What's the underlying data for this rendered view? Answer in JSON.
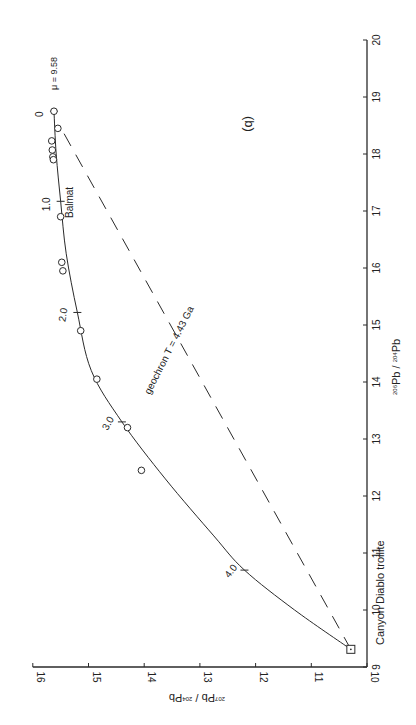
{
  "chart_data": {
    "type": "scatter",
    "orientation": "rotated-90-clockwise",
    "panel_label": "(b)",
    "xlabel": "206Pb / 204Pb",
    "ylabel": "207Pb / 204Pb",
    "xlim": [
      9,
      20
    ],
    "ylim": [
      10,
      16
    ],
    "x_ticks": [
      9,
      10,
      11,
      12,
      13,
      14,
      15,
      16,
      17,
      18,
      19,
      20
    ],
    "y_ticks": [
      10,
      11,
      12,
      13,
      14,
      15,
      16
    ],
    "grid": false,
    "growth_curve": {
      "name": "μ = 9.58",
      "age_labels": [
        {
          "label": "0",
          "x": 18.75,
          "y": 15.62
        },
        {
          "label": "1.0",
          "x": 17.17,
          "y": 15.5
        },
        {
          "label": "2.0",
          "x": 15.22,
          "y": 15.2
        },
        {
          "label": "3.0",
          "x": 13.3,
          "y": 14.4
        },
        {
          "label": "4.0",
          "x": 10.7,
          "y": 12.2
        }
      ],
      "minor_ticks_Ga": [
        0.5,
        1.5,
        2.5,
        3.5
      ],
      "points": [
        {
          "x": 18.75,
          "y": 15.62
        },
        {
          "x": 18.0,
          "y": 15.58
        },
        {
          "x": 17.17,
          "y": 15.5
        },
        {
          "x": 16.25,
          "y": 15.4
        },
        {
          "x": 15.22,
          "y": 15.2
        },
        {
          "x": 14.2,
          "y": 14.95
        },
        {
          "x": 13.3,
          "y": 14.4
        },
        {
          "x": 12.3,
          "y": 13.62
        },
        {
          "x": 11.3,
          "y": 12.75
        },
        {
          "x": 10.7,
          "y": 12.2
        },
        {
          "x": 10.0,
          "y": 11.3
        },
        {
          "x": 9.31,
          "y": 10.29
        }
      ]
    },
    "geochron": {
      "label": "geochron  T = 4.43 Ga",
      "style": "dashed",
      "from": {
        "x": 9.31,
        "y": 10.29
      },
      "to": {
        "x": 18.5,
        "y": 15.52
      }
    },
    "samples": [
      {
        "x": 18.75,
        "y": 15.62
      },
      {
        "x": 18.45,
        "y": 15.55
      },
      {
        "x": 18.23,
        "y": 15.66
      },
      {
        "x": 18.07,
        "y": 15.65
      },
      {
        "x": 17.95,
        "y": 15.64
      },
      {
        "x": 17.9,
        "y": 15.63
      },
      {
        "x": 16.9,
        "y": 15.5,
        "label": "Balmat"
      },
      {
        "x": 16.1,
        "y": 15.48
      },
      {
        "x": 15.95,
        "y": 15.46
      },
      {
        "x": 14.9,
        "y": 15.14
      },
      {
        "x": 14.05,
        "y": 14.85
      },
      {
        "x": 13.2,
        "y": 14.3
      },
      {
        "x": 12.45,
        "y": 14.05
      }
    ],
    "reference_point": {
      "label": "Canyon Diablo troilite",
      "x": 9.31,
      "y": 10.29,
      "marker": "square-dot"
    }
  },
  "labels": {
    "panel": "(b)",
    "mu": "μ = 9.58",
    "balmat": "Balmat",
    "geochron": "geochron  T = 4.43 Ga",
    "canyon": "Canyon Diablo troilite",
    "xaxis_a": "206",
    "xaxis_b": "Pb / ",
    "xaxis_c": "204",
    "xaxis_d": "Pb",
    "yaxis_a": "207",
    "yaxis_b": "Pb / ",
    "yaxis_c": "204",
    "yaxis_d": "Pb"
  }
}
